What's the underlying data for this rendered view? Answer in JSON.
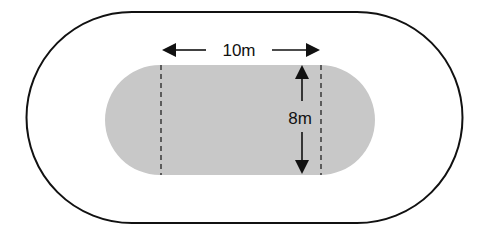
{
  "diagram": {
    "type": "stadium-track",
    "outer_track": {
      "stroke": "#111111",
      "fill": "#ffffff"
    },
    "inner_field": {
      "fill": "#c8c8c8",
      "straight_length_label": "10m",
      "width_label": "8m"
    },
    "labels": {
      "length": "10m",
      "width": "8m"
    },
    "colors": {
      "outline": "#111111",
      "field": "#c8c8c8",
      "background": "#ffffff"
    }
  }
}
